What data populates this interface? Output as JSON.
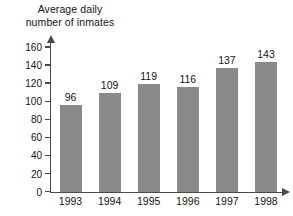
{
  "chart_data": {
    "type": "bar",
    "title": "Average daily\nnumber of inmates",
    "title_line1": "Average daily",
    "title_line2": "number of inmates",
    "xlabel": "",
    "ylabel": "Average daily number of inmates",
    "categories": [
      "1993",
      "1994",
      "1995",
      "1996",
      "1997",
      "1998"
    ],
    "values": [
      96,
      109,
      119,
      116,
      137,
      143
    ],
    "data_labels": [
      "96",
      "109",
      "119",
      "116",
      "137",
      "143"
    ],
    "ylim": [
      0,
      160
    ],
    "ytick_step": 20,
    "yticks": [
      0,
      20,
      40,
      60,
      80,
      100,
      120,
      140,
      160
    ],
    "ytick_labels": [
      "0",
      "20",
      "40",
      "60",
      "80",
      "100",
      "120",
      "140",
      "160"
    ],
    "grid": false,
    "legend": false,
    "legend_position": "none",
    "bar_color": "#8a8a8a",
    "axis_color": "#4a4a4a",
    "text_color": "#141414",
    "background": "#ffffff",
    "series": [
      {
        "name": "Average daily number of inmates",
        "values": [
          96,
          109,
          119,
          116,
          137,
          143
        ]
      }
    ]
  }
}
